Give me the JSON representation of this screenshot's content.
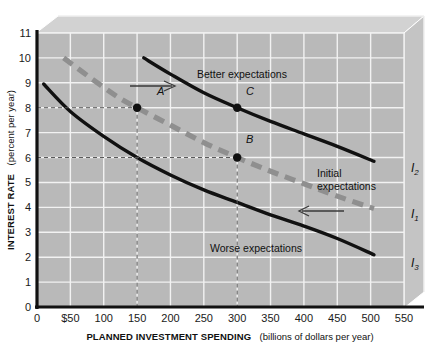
{
  "chart_data": {
    "type": "line",
    "title": "",
    "xlabel_bold": "PLANNED INVESTMENT SPENDING",
    "xlabel_sub": "(billions of dollars per year)",
    "ylabel_bold": "INTEREST RATE",
    "ylabel_sub": "(percent per year)",
    "xlim": [
      0,
      550
    ],
    "ylim": [
      0,
      11
    ],
    "grid": true,
    "legend_position": "inline-curve-labels",
    "x_ticks": [
      "0",
      "$50",
      "100",
      "150",
      "200",
      "250",
      "300",
      "350",
      "400",
      "450",
      "500",
      "550"
    ],
    "x_tick_values": [
      0,
      50,
      100,
      150,
      200,
      250,
      300,
      350,
      400,
      450,
      500,
      550
    ],
    "y_ticks": [
      "0",
      "1",
      "2",
      "3",
      "4",
      "5",
      "6",
      "7",
      "8",
      "9",
      "10",
      "11"
    ],
    "y_tick_values": [
      0,
      1,
      2,
      3,
      4,
      5,
      6,
      7,
      8,
      9,
      10,
      11
    ],
    "series": [
      {
        "name": "I2",
        "label": "I",
        "subscript": "2",
        "style": "solid-black",
        "annotation": "Better expectations",
        "x": [
          160,
          200,
          250,
          300,
          350,
          400,
          450,
          505
        ],
        "y": [
          10.0,
          9.35,
          8.6,
          8.0,
          7.45,
          6.95,
          6.45,
          5.85
        ]
      },
      {
        "name": "I1",
        "label": "I",
        "subscript": "1",
        "style": "dashed-gray",
        "annotation": "Initial expectations",
        "x": [
          40,
          75,
          120,
          150,
          200,
          250,
          300,
          350,
          400,
          450,
          505
        ],
        "y": [
          10.0,
          9.3,
          8.45,
          8.0,
          7.3,
          6.6,
          6.0,
          5.45,
          4.95,
          4.45,
          3.95
        ]
      },
      {
        "name": "I3",
        "label": "I",
        "subscript": "3",
        "style": "solid-black",
        "annotation": "Worse expectations",
        "x": [
          10,
          50,
          100,
          150,
          200,
          250,
          300,
          350,
          400,
          450,
          505
        ],
        "y": [
          8.95,
          7.85,
          6.85,
          6.0,
          5.3,
          4.7,
          4.2,
          3.7,
          3.25,
          2.75,
          2.1
        ]
      }
    ],
    "points": [
      {
        "label": "A",
        "x": 150,
        "y": 8,
        "on_series": "I1"
      },
      {
        "label": "B",
        "x": 300,
        "y": 6,
        "on_series": "I1"
      },
      {
        "label": "C",
        "x": 300,
        "y": 8,
        "on_series": "I2"
      }
    ],
    "guide_lines": [
      {
        "type": "horizontal",
        "y": 8,
        "from_x": 0,
        "to_x": 150
      },
      {
        "type": "horizontal",
        "y": 6,
        "from_x": 0,
        "to_x": 300
      },
      {
        "type": "vertical",
        "x": 150,
        "from_y": 0,
        "to_y": 8
      },
      {
        "type": "vertical",
        "x": 300,
        "from_y": 0,
        "to_y": 6
      }
    ],
    "arrows": [
      {
        "name": "shift-right-arrow",
        "direction": "right",
        "meaning": "shift to better expectations"
      },
      {
        "name": "shift-left-arrow",
        "direction": "left",
        "meaning": "shift to worse expectations"
      }
    ],
    "annotations": [
      {
        "name": "better-expectations-label",
        "text": "Better expectations"
      },
      {
        "name": "initial-expectations-label-line1",
        "text": "Initial"
      },
      {
        "name": "initial-expectations-label-line2",
        "text": "expectations"
      },
      {
        "name": "worse-expectations-label",
        "text": "Worse expectations"
      }
    ],
    "colors": {
      "plot_background": "#b9b9b9",
      "frame_bevel_light": "#d6d6d6",
      "frame_bevel_mid": "#c9c9c9",
      "gridline": "#f2f2f2",
      "axis": "#111111",
      "curve_solid": "#111111",
      "curve_dashed": "#8f8f8f",
      "guide_line": "#555555"
    }
  }
}
